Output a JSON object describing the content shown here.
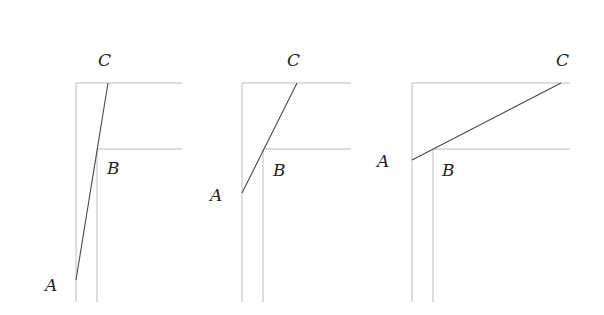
{
  "figure": {
    "panels": [
      {
        "id": "panel-1",
        "outer_vertical_x": 76,
        "inner_vertical_x": 97,
        "top_y": 83,
        "mid_y": 149,
        "bottom_y": 302,
        "right_x": 182,
        "point_A": [
          76,
          280
        ],
        "point_C": [
          108,
          83
        ],
        "labels": {
          "A": {
            "text": "A",
            "x": 45,
            "y": 291
          },
          "B": {
            "text": "B",
            "x": 107,
            "y": 174
          },
          "C": {
            "text": "C",
            "x": 98,
            "y": 66
          }
        }
      },
      {
        "id": "panel-2",
        "outer_vertical_x": 242,
        "inner_vertical_x": 263,
        "top_y": 83,
        "mid_y": 149,
        "bottom_y": 302,
        "right_x": 351,
        "point_A": [
          242,
          193
        ],
        "point_C": [
          297,
          83
        ],
        "labels": {
          "A": {
            "text": "A",
            "x": 210,
            "y": 201
          },
          "B": {
            "text": "B",
            "x": 273,
            "y": 176
          },
          "C": {
            "text": "C",
            "x": 287,
            "y": 66
          }
        }
      },
      {
        "id": "panel-3",
        "outer_vertical_x": 412,
        "inner_vertical_x": 433,
        "top_y": 83,
        "mid_y": 149,
        "bottom_y": 302,
        "right_x": 570,
        "point_A": [
          412,
          160
        ],
        "point_C": [
          561,
          83
        ],
        "labels": {
          "A": {
            "text": "A",
            "x": 377,
            "y": 167
          },
          "B": {
            "text": "B",
            "x": 442,
            "y": 176
          },
          "C": {
            "text": "C",
            "x": 556,
            "y": 66
          }
        }
      }
    ],
    "colors": {
      "frame": "#bdbdbd",
      "segment": "#4a4a4a",
      "label": "#222222"
    }
  }
}
